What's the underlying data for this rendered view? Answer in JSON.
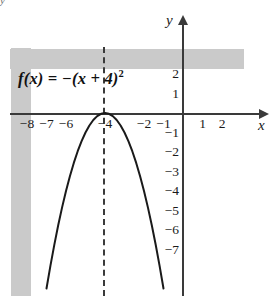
{
  "figure": {
    "top_artifact": "y",
    "function_label_main": "f(x) = −(x + 4)",
    "function_label_exponent": "2",
    "x_axis_name": "x",
    "y_axis_name": "y"
  },
  "chart_data": {
    "type": "line",
    "title": "",
    "subtitle": "",
    "xlabel": "x",
    "ylabel": "y",
    "function": "f(x) = -(x + 4)^2",
    "vertex": [
      -4,
      0
    ],
    "axis_of_symmetry": -4,
    "opens": "down",
    "xlim": [
      -8.8,
      3.2
    ],
    "ylim": [
      -9.4,
      3.3
    ],
    "grid": true,
    "grid_style": "dotted",
    "legend": "none",
    "x_tick_labels": [
      "−8",
      "−7",
      "−6",
      "−4",
      "−2",
      "−1",
      "1",
      "2"
    ],
    "x_tick_values": [
      -8,
      -7,
      -6,
      -4,
      -2,
      -1,
      1,
      2
    ],
    "y_tick_labels": [
      "2",
      "1",
      "−1",
      "−2",
      "−3",
      "−4",
      "−5",
      "−6",
      "−7"
    ],
    "y_tick_values": [
      2,
      1,
      -1,
      -2,
      -3,
      -4,
      -5,
      -6,
      -7
    ],
    "series": [
      {
        "name": "f(x) = -(x + 4)^2",
        "x": [
          -7.0,
          -6.8,
          -6.6,
          -6.4,
          -6.2,
          -6.0,
          -5.8,
          -5.6,
          -5.4,
          -5.2,
          -5.0,
          -4.8,
          -4.6,
          -4.4,
          -4.2,
          -4.0,
          -3.8,
          -3.6,
          -3.4,
          -3.2,
          -3.0,
          -2.8,
          -2.6,
          -2.4,
          -2.2,
          -2.0,
          -1.8,
          -1.6,
          -1.4,
          -1.2,
          -1.0
        ],
        "y": [
          -9.0,
          -7.84,
          -6.76,
          -5.76,
          -4.84,
          -4.0,
          -3.24,
          -2.56,
          -1.96,
          -1.44,
          -1.0,
          -0.64,
          -0.36,
          -0.16,
          -0.04,
          0.0,
          -0.04,
          -0.16,
          -0.36,
          -0.64,
          -1.0,
          -1.44,
          -1.96,
          -2.56,
          -3.24,
          -4.0,
          -4.84,
          -5.76,
          -6.76,
          -7.84,
          -9.0
        ]
      }
    ],
    "annotations": [
      {
        "text": "f(x) = −(x + 4)²",
        "x": -7.5,
        "y": 2.0
      },
      {
        "text": "axis of symmetry x = −4",
        "style": "dashed-vertical-line",
        "x": -4
      }
    ],
    "colors": {
      "curve": "#1a1a1a",
      "axis": "#3a3a3a",
      "grid": "#b9b9b9",
      "background": "#ffffff",
      "text": "#111111"
    }
  }
}
